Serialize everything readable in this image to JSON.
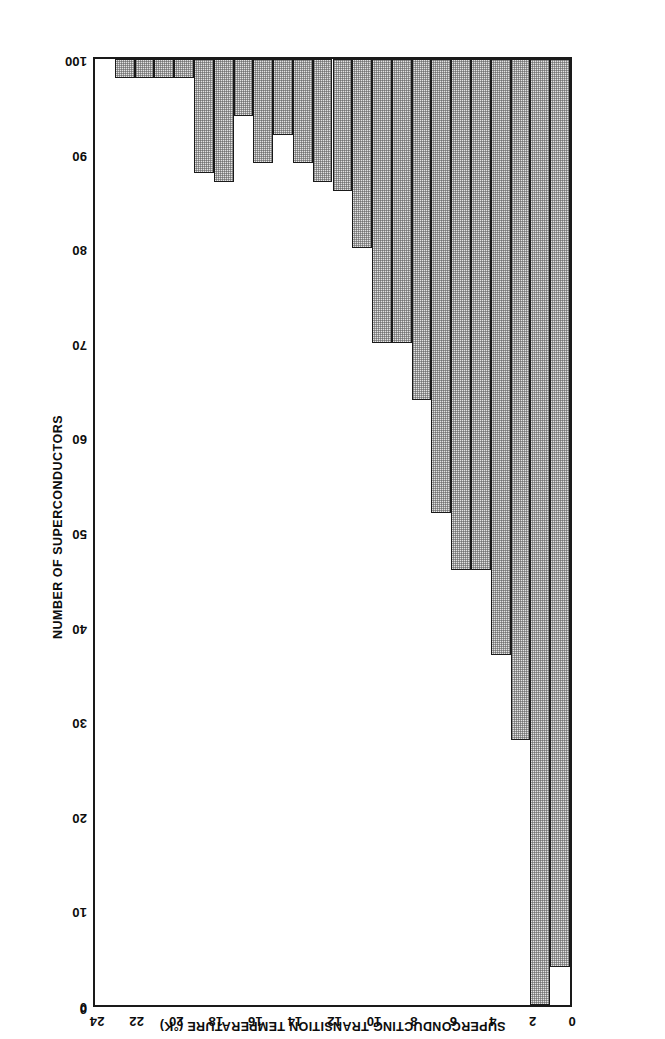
{
  "chart_data": {
    "type": "bar",
    "orientation": "vertical",
    "title": "",
    "xlabel": "SUPERCONDUCTING TRANSITION TEMPERATURE (°K)",
    "ylabel": "NUMBER OF SUPERCONDUCTORS",
    "xlim": [
      0,
      24
    ],
    "ylim": [
      0,
      100
    ],
    "xticks": [
      "0",
      "2",
      "4",
      "6",
      "8",
      "10",
      "12",
      "14",
      "16",
      "18",
      "20",
      "22",
      "24"
    ],
    "xtick_values": [
      0,
      2,
      4,
      6,
      8,
      10,
      12,
      14,
      16,
      18,
      20,
      22,
      24
    ],
    "yticks": [
      "0",
      "10",
      "20",
      "30",
      "40",
      "50",
      "60",
      "70",
      "80",
      "90",
      "100"
    ],
    "ytick_values": [
      0,
      10,
      20,
      30,
      40,
      50,
      60,
      70,
      80,
      90,
      100
    ],
    "grid": false,
    "bin_width": 1,
    "bar_fill": "#e3e3e3",
    "bar_edge": "#1a1a1a",
    "categories": [
      "0-1",
      "1-2",
      "2-3",
      "3-4",
      "4-5",
      "5-6",
      "6-7",
      "7-8",
      "8-9",
      "9-10",
      "10-11",
      "11-12",
      "12-13",
      "13-14",
      "14-15",
      "15-16",
      "16-17",
      "17-18",
      "18-19",
      "19-20",
      "20-21",
      "21-22",
      "22-23",
      "23-24"
    ],
    "bin_starts": [
      0,
      1,
      2,
      3,
      4,
      5,
      6,
      7,
      8,
      9,
      10,
      11,
      12,
      13,
      14,
      15,
      16,
      17,
      18,
      19,
      20,
      21,
      22,
      23
    ],
    "values": [
      96,
      100,
      72,
      63,
      54,
      54,
      48,
      36,
      30,
      30,
      20,
      14,
      13,
      11,
      8,
      11,
      6,
      13,
      12,
      2,
      2,
      2,
      2,
      0
    ],
    "annotations": []
  },
  "figure": {
    "origin_label": "0",
    "rotated_180": true
  }
}
